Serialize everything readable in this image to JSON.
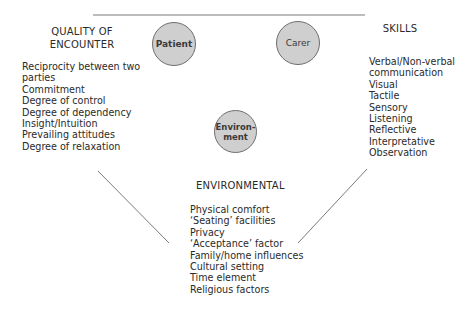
{
  "diagram": {
    "nodes": [
      {
        "id": "patient",
        "label": "Patient"
      },
      {
        "id": "carer",
        "label": "Carer"
      },
      {
        "id": "environment",
        "label_line1": "Environ-",
        "label_line2": "ment"
      }
    ],
    "quality": {
      "heading_line1": "QUALITY OF",
      "heading_line2": "ENCOUNTER",
      "items": [
        "Reciprocity between two",
        "parties",
        "Commitment",
        "Degree of control",
        "Degree of dependency",
        "Insight/Intuition",
        "Prevailing attitudes",
        "Degree of relaxation"
      ]
    },
    "skills": {
      "heading": "SKILLS",
      "items": [
        "Verbal/Non-verbal",
        "communication",
        "Visual",
        "Tactile",
        "Sensory",
        "Listening",
        "Reflective",
        "Interpretative",
        "Observation"
      ]
    },
    "environmental": {
      "heading": "ENVIRONMENTAL",
      "items": [
        "Physical comfort",
        "‘Seating’ facilities",
        "Privacy",
        "‘Acceptance’ factor",
        "Family/home influences",
        "Cultural setting",
        "Time element",
        "Religious factors"
      ]
    },
    "colors": {
      "circle_fill": "#cfcfcf",
      "circle_stroke": "#6e6e6e",
      "line": "#7a7a7a",
      "text": "#2a2a2a"
    }
  }
}
